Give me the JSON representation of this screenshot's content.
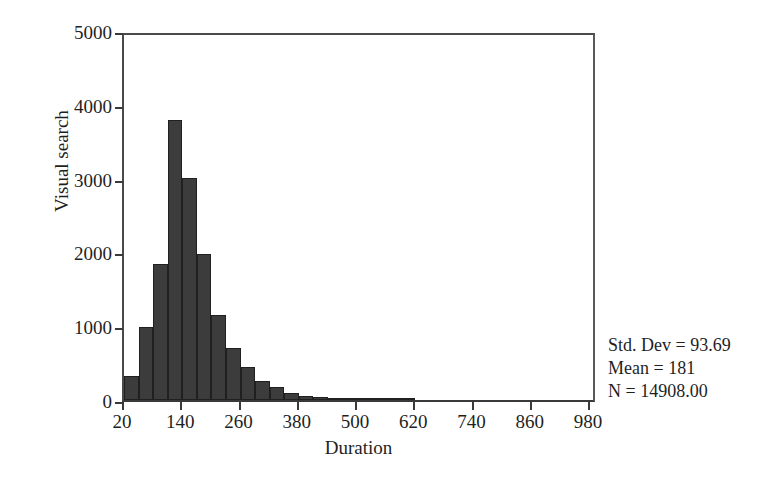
{
  "figure": {
    "background": "#ffffff",
    "bar_color": "#3c3c3c",
    "axis_color": "#3a3a3a"
  },
  "chart_data": {
    "type": "bar",
    "title": "",
    "subtitle": "",
    "xlabel": "Duration",
    "ylabel": "Visual search",
    "xlim": [
      -10,
      1010
    ],
    "ylim": [
      0,
      5000
    ],
    "grid": false,
    "legend": null,
    "bin_width": 30,
    "x_ticks": [
      20,
      140,
      260,
      380,
      500,
      620,
      740,
      860,
      980
    ],
    "x_tick_labels": [
      "20",
      "140",
      "260",
      "380",
      "500",
      "620",
      "740",
      "860",
      "980"
    ],
    "y_ticks": [
      0,
      1000,
      2000,
      3000,
      4000,
      5000
    ],
    "y_tick_labels": [
      "0",
      "1000",
      "2000",
      "3000",
      "4000",
      "5000"
    ],
    "bin_starts": [
      20,
      50,
      80,
      110,
      140,
      170,
      200,
      230,
      260,
      290,
      320,
      350,
      380,
      410,
      440,
      470,
      500,
      530,
      560,
      590
    ],
    "bin_centers": [
      35,
      65,
      95,
      125,
      155,
      185,
      215,
      245,
      275,
      305,
      335,
      365,
      395,
      425,
      455,
      485,
      515,
      545,
      575,
      605
    ],
    "values": [
      330,
      990,
      1840,
      3800,
      3010,
      1980,
      1150,
      700,
      450,
      260,
      170,
      100,
      60,
      40,
      25,
      15,
      10,
      8,
      5,
      3
    ],
    "annotations": [
      "Std. Dev = 93.69",
      "Mean = 181",
      "N = 14908.00"
    ],
    "stats": {
      "std_dev": "Std. Dev = 93.69",
      "mean": "Mean = 181",
      "n": "N = 14908.00"
    }
  }
}
